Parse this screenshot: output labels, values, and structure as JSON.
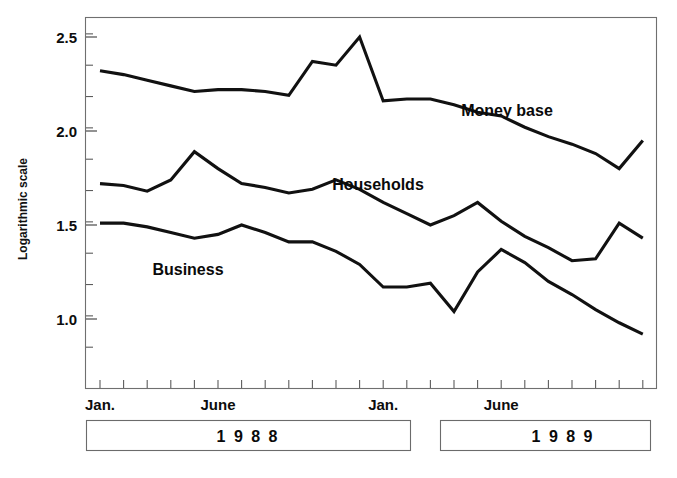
{
  "chart_data": {
    "type": "line",
    "title": "",
    "subtitle": "",
    "xlabel": "",
    "ylabel": "Logarithmic scale",
    "ylim": [
      0.72,
      2.62
    ],
    "yticks": [
      1.0,
      1.5,
      2.0,
      2.5
    ],
    "ytick_labels": [
      "1.0",
      "1.5",
      "2.0",
      "2.5"
    ],
    "y_minor_ticks_per_major": 2,
    "grid": false,
    "legend_position": "inline-annotations",
    "x": [
      "1988-01",
      "1988-02",
      "1988-03",
      "1988-04",
      "1988-05",
      "1988-06",
      "1988-07",
      "1988-08",
      "1988-09",
      "1988-10",
      "1988-11",
      "1988-12",
      "1989-01",
      "1989-02",
      "1989-03",
      "1989-04",
      "1989-05",
      "1989-06",
      "1989-07",
      "1989-08",
      "1989-09",
      "1989-10",
      "1989-11",
      "1989-12"
    ],
    "xtick_labels": [
      "Jan.",
      "June",
      "Jan.",
      "June"
    ],
    "xtick_label_positions": [
      "1988-01",
      "1988-06",
      "1989-01",
      "1989-06"
    ],
    "x_axis_groups": [
      {
        "label": "1 9 8 8",
        "start": "1988-01",
        "end": "1988-12"
      },
      {
        "label": "1 9 8 9",
        "start": "1989-01",
        "end": "1989-12"
      }
    ],
    "series": [
      {
        "name": "Money base",
        "label": "Money base",
        "color": "#111111",
        "values": [
          2.32,
          2.3,
          2.27,
          2.24,
          2.21,
          2.22,
          2.22,
          2.21,
          2.19,
          2.37,
          2.35,
          2.5,
          2.16,
          2.17,
          2.17,
          2.14,
          2.1,
          2.08,
          2.02,
          1.97,
          1.93,
          1.88,
          1.8,
          1.95
        ]
      },
      {
        "name": "Households",
        "label": "Households",
        "color": "#111111",
        "values": [
          1.72,
          1.71,
          1.68,
          1.74,
          1.89,
          1.8,
          1.72,
          1.7,
          1.67,
          1.69,
          1.74,
          1.69,
          1.62,
          1.56,
          1.5,
          1.55,
          1.62,
          1.52,
          1.44,
          1.38,
          1.31,
          1.32,
          1.51,
          1.43
        ]
      },
      {
        "name": "Business",
        "label": "Business",
        "color": "#111111",
        "values": [
          1.51,
          1.51,
          1.49,
          1.46,
          1.43,
          1.45,
          1.5,
          1.46,
          1.41,
          1.41,
          1.36,
          1.29,
          1.17,
          1.17,
          1.19,
          1.04,
          1.25,
          1.37,
          1.3,
          1.2,
          1.13,
          1.05,
          0.98,
          0.92
        ]
      }
    ],
    "annotations": [
      {
        "text": "Money base",
        "series": "Money base"
      },
      {
        "text": "Households",
        "series": "Households"
      },
      {
        "text": "Business",
        "series": "Business"
      }
    ]
  },
  "axis": {
    "y_title": "Logarithmic scale"
  }
}
